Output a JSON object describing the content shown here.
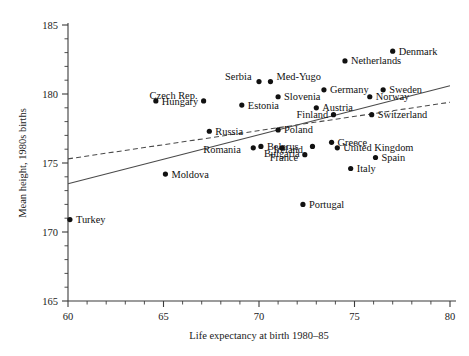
{
  "chart_data": {
    "type": "scatter",
    "title": "",
    "xlabel": "Life expectancy at birth 1980–85",
    "ylabel": "Mean height, 1980s births",
    "xlim": [
      60,
      80
    ],
    "ylim": [
      165,
      185
    ],
    "xticks": [
      60,
      65,
      70,
      75,
      80
    ],
    "yticks": [
      165,
      170,
      175,
      180,
      185
    ],
    "xtick_labels": [
      "60",
      "65",
      "70",
      "75",
      "80"
    ],
    "ytick_labels": [
      "165",
      "170",
      "175",
      "180",
      "185"
    ],
    "x_minor_step": 1,
    "y_minor_step": 1,
    "grid": false,
    "legend": "none",
    "points": [
      {
        "label": "Turkey",
        "x": 60.1,
        "y": 170.9,
        "lx": 6,
        "ly": 3.6
      },
      {
        "label": "Moldova",
        "x": 65.1,
        "y": 174.2,
        "lx": 6,
        "ly": 3.6
      },
      {
        "label": "Hungary",
        "x": 64.6,
        "y": 179.5,
        "lx": 6,
        "ly": 3.6
      },
      {
        "label": "Czech Rep.",
        "x": 67.1,
        "y": 179.5,
        "lx": -54,
        "ly": -2
      },
      {
        "label": "Serbia",
        "x": 70.0,
        "y": 180.9,
        "lx": -34,
        "ly": -2
      },
      {
        "label": "Med-Yugo",
        "x": 70.6,
        "y": 180.9,
        "lx": 6,
        "ly": -2
      },
      {
        "label": "Estonia",
        "x": 69.1,
        "y": 179.2,
        "lx": 6,
        "ly": 3.6
      },
      {
        "label": "Slovenia",
        "x": 71.0,
        "y": 179.8,
        "lx": 6,
        "ly": 3.6
      },
      {
        "label": "Germany",
        "x": 73.4,
        "y": 180.3,
        "lx": 6,
        "ly": 3.6
      },
      {
        "label": "Sweden",
        "x": 76.5,
        "y": 180.3,
        "lx": 6,
        "ly": 3.6
      },
      {
        "label": "Norway",
        "x": 75.8,
        "y": 179.8,
        "lx": 6,
        "ly": 3.6
      },
      {
        "label": "Netherlands",
        "x": 74.5,
        "y": 182.4,
        "lx": 6,
        "ly": 3.6
      },
      {
        "label": "Denmark",
        "x": 77.0,
        "y": 183.1,
        "lx": 6,
        "ly": 3.6
      },
      {
        "label": "Austria",
        "x": 73.0,
        "y": 179.0,
        "lx": 6,
        "ly": 3.6
      },
      {
        "label": "Finland",
        "x": 73.9,
        "y": 178.5,
        "lx": -37,
        "ly": 3.6
      },
      {
        "label": "Switzerland",
        "x": 75.9,
        "y": 178.5,
        "lx": 6,
        "ly": 3.6
      },
      {
        "label": "Russia",
        "x": 67.4,
        "y": 177.3,
        "lx": 6,
        "ly": 3.6
      },
      {
        "label": "Poland",
        "x": 71.0,
        "y": 177.4,
        "lx": 6,
        "ly": 3.6
      },
      {
        "label": "Greece",
        "x": 73.8,
        "y": 176.5,
        "lx": 6,
        "ly": 3.6
      },
      {
        "label": "United Kingdom",
        "x": 74.1,
        "y": 176.1,
        "lx": 6,
        "ly": 3.6
      },
      {
        "label": "Belarus",
        "x": 70.1,
        "y": 176.2,
        "lx": 6,
        "ly": 3.6
      },
      {
        "label": "Romania",
        "x": 69.7,
        "y": 176.1,
        "lx": -50,
        "ly": 5.2
      },
      {
        "label": "Bulgaria",
        "x": 71.2,
        "y": 176.1,
        "lx": -18,
        "ly": 9
      },
      {
        "label": "Ireland",
        "x": 72.8,
        "y": 176.2,
        "lx": -39,
        "ly": 6.5
      },
      {
        "label": "France",
        "x": 72.4,
        "y": 175.6,
        "lx": -35,
        "ly": 6.5
      },
      {
        "label": "Spain",
        "x": 76.1,
        "y": 175.4,
        "lx": 6,
        "ly": 3.6
      },
      {
        "label": "Italy",
        "x": 74.8,
        "y": 174.6,
        "lx": 6,
        "ly": 3.6
      },
      {
        "label": "Portugal",
        "x": 72.3,
        "y": 172.0,
        "lx": 6,
        "ly": 3.6
      }
    ],
    "trend_lines": [
      {
        "name": "solid-fit",
        "style": "solid",
        "x0": 60.0,
        "y0": 173.5,
        "x1": 80.0,
        "y1": 180.6
      },
      {
        "name": "dashed-fit",
        "style": "dashed",
        "x0": 60.0,
        "y0": 175.3,
        "x1": 80.0,
        "y1": 179.4
      }
    ]
  }
}
